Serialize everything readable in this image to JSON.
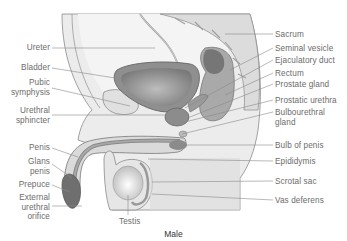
{
  "caption": "Male",
  "labels_left": [
    {
      "id": "ureter",
      "text": "Ureter",
      "x": 50,
      "y": 43,
      "lx": [
        52,
        155
      ],
      "ly": [
        48,
        48
      ]
    },
    {
      "id": "bladder",
      "text": "Bladder",
      "x": 50,
      "y": 63,
      "lx": [
        52,
        115
      ],
      "ly": [
        68,
        78
      ]
    },
    {
      "id": "pubic-symphysis",
      "text": "Pubic\nsymphysis",
      "x": 50,
      "y": 78,
      "lx": [
        52,
        130
      ],
      "ly": [
        88,
        106
      ]
    },
    {
      "id": "urethral-sphincter",
      "text": "Urethral\nsphincter",
      "x": 50,
      "y": 106,
      "lx": [
        52,
        170
      ],
      "ly": [
        115,
        115
      ]
    },
    {
      "id": "penis",
      "text": "Penis",
      "x": 50,
      "y": 143,
      "lx": [
        52,
        78
      ],
      "ly": [
        148,
        157
      ]
    },
    {
      "id": "glans-penis",
      "text": "Glans\npenis",
      "x": 50,
      "y": 157,
      "lx": [
        52,
        72
      ],
      "ly": [
        164,
        178
      ]
    },
    {
      "id": "prepuce",
      "text": "Prepuce",
      "x": 50,
      "y": 180,
      "lx": [
        52,
        70
      ],
      "ly": [
        185,
        192
      ]
    },
    {
      "id": "external-urethral-orifice",
      "text": "External\nurethral\norifice",
      "x": 50,
      "y": 193,
      "lx": [
        52,
        82
      ],
      "ly": [
        206,
        206
      ]
    }
  ],
  "labels_right": [
    {
      "id": "sacrum",
      "text": "Sacrum",
      "x": 275,
      "y": 30,
      "lx": [
        225,
        273
      ],
      "ly": [
        34,
        34
      ]
    },
    {
      "id": "seminal-vesicle",
      "text": "Seminal vesicle",
      "x": 275,
      "y": 44,
      "lx": [
        230,
        273
      ],
      "ly": [
        70,
        48
      ]
    },
    {
      "id": "ejaculatory-duct",
      "text": "Ejaculatory duct",
      "x": 275,
      "y": 56,
      "lx": [
        185,
        273
      ],
      "ly": [
        108,
        60
      ]
    },
    {
      "id": "rectum",
      "text": "Rectum",
      "x": 275,
      "y": 69,
      "lx": [
        225,
        273
      ],
      "ly": [
        95,
        73
      ]
    },
    {
      "id": "prostate-gland",
      "text": "Prostate gland",
      "x": 275,
      "y": 80,
      "lx": [
        190,
        273
      ],
      "ly": [
        117,
        84
      ]
    },
    {
      "id": "prostatic-urethra",
      "text": "Prostatic urethra",
      "x": 275,
      "y": 96,
      "lx": [
        185,
        273
      ],
      "ly": [
        122,
        100
      ]
    },
    {
      "id": "bulbourethral-gland",
      "text": "Bulbourethral\ngland",
      "x": 275,
      "y": 108,
      "lx": [
        182,
        273
      ],
      "ly": [
        134,
        112
      ]
    },
    {
      "id": "bulb-of-penis",
      "text": "Bulb of penis",
      "x": 275,
      "y": 141,
      "lx": [
        180,
        273
      ],
      "ly": [
        145,
        145
      ]
    },
    {
      "id": "epididymis",
      "text": "Epididymis",
      "x": 275,
      "y": 157,
      "lx": [
        148,
        273
      ],
      "ly": [
        159,
        161
      ]
    },
    {
      "id": "scrotal-sac",
      "text": "Scrotal sac",
      "x": 275,
      "y": 177,
      "lx": [
        152,
        273
      ],
      "ly": [
        182,
        181
      ]
    },
    {
      "id": "vas-deferens",
      "text": "Vas deferens",
      "x": 275,
      "y": 196,
      "lx": [
        152,
        273
      ],
      "ly": [
        194,
        200
      ]
    }
  ],
  "labels_bottom": [
    {
      "id": "testis",
      "text": "Testis",
      "x": 119,
      "y": 217,
      "lx": [
        128,
        128
      ],
      "ly": [
        195,
        215
      ]
    }
  ]
}
